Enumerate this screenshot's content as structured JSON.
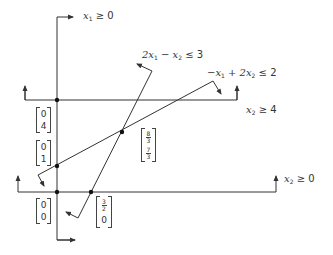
{
  "diagram": {
    "type": "linear-program-feasible-region",
    "constraints": [
      {
        "id": "c1",
        "label_parts": [
          "x",
          "1",
          " ≥ 0"
        ],
        "text": "x1 ≥ 0"
      },
      {
        "id": "c2",
        "label_parts": [
          "2x",
          "1",
          " − x",
          "2",
          " ≤ 3"
        ],
        "text": "2x1 − x2 ≤ 3"
      },
      {
        "id": "c3",
        "label_parts": [
          "−x",
          "1",
          " + 2x",
          "2",
          " ≤ 2"
        ],
        "text": "−x1 + 2x2 ≤ 2"
      },
      {
        "id": "c4",
        "label_parts": [
          "x",
          "2",
          " ≥ 4"
        ],
        "text": "x2 ≥ 4"
      },
      {
        "id": "c5",
        "label_parts": [
          "x",
          "2",
          " ≥ 0"
        ],
        "text": "x2 ≥ 0"
      }
    ],
    "vertices": [
      {
        "id": "v04",
        "top": "0",
        "bottom": "4"
      },
      {
        "id": "v01",
        "top": "0",
        "bottom": "1"
      },
      {
        "id": "v00",
        "top": "0",
        "bottom": "0"
      },
      {
        "id": "v320",
        "top_num": "3",
        "top_den": "2",
        "bottom": "0"
      },
      {
        "id": "v8373",
        "top_num": "8",
        "top_den": "3",
        "bottom_num": "7",
        "bottom_den": "3"
      }
    ],
    "colors": {
      "line": "#333333",
      "text": "#333333",
      "background": "#ffffff"
    }
  }
}
